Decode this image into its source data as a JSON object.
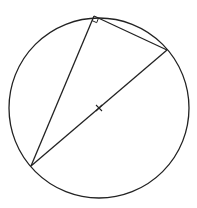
{
  "diagram": {
    "type": "geometry",
    "canvas": {
      "width": 197,
      "height": 208
    },
    "stroke_color": "#222222",
    "background": "#ffffff",
    "circle": {
      "cx": 99,
      "cy": 108,
      "r": 90
    },
    "center_mark": {
      "x": 99,
      "y": 108,
      "symbol": "x"
    },
    "vertices": {
      "top": {
        "x": 94,
        "y": 16
      },
      "right": {
        "x": 167,
        "y": 50
      },
      "bottom_left": {
        "x": 31,
        "y": 166
      }
    },
    "right_angle_at": "top",
    "segments": [
      {
        "from": "top",
        "to": "right"
      },
      {
        "from": "top",
        "to": "bottom_left"
      },
      {
        "from": "right",
        "to": "bottom_left",
        "label": "diameter"
      }
    ]
  }
}
